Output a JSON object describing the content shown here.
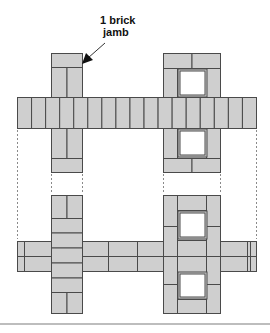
{
  "diagram": {
    "annotation": {
      "line1": "1 brick",
      "line2": "jamb",
      "points_to": "left-jamb-upper"
    },
    "colors": {
      "brick_fill": "#cfcfcf",
      "mortar_line": "#4a4a4a",
      "opening_fill": "#ffffff",
      "guide_line": "#8a8a8a",
      "rule": "#bdbdbd"
    },
    "courses": [
      {
        "name": "upper-course",
        "wall": {
          "bond": "headers",
          "brick_count": 17
        },
        "left_jamb": {
          "type": "1 brick jamb",
          "bricks": [
            "header",
            "stretcher-pair",
            "stretcher-pair",
            "header"
          ]
        },
        "right_jamb": {
          "type": "jamb with openings",
          "openings": 2
        }
      },
      {
        "name": "lower-course",
        "wall": {
          "bond": "stretchers",
          "rows": 2
        },
        "left_jamb": {
          "type": "1 brick jamb",
          "bricks": [
            "stretcher-pair",
            "header",
            "header",
            "header",
            "header",
            "header",
            "stretcher-pair"
          ]
        },
        "right_jamb": {
          "type": "jamb with openings",
          "openings": 2
        }
      }
    ]
  }
}
